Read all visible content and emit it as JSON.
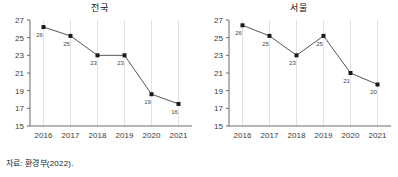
{
  "source_note": "자료: 환경부(2022).",
  "chart_data": [
    {
      "type": "line",
      "title": "전국",
      "xlabel": "",
      "ylabel": "",
      "grid": "vertical",
      "legend": "none",
      "categories": [
        "2016",
        "2017",
        "2018",
        "2019",
        "2020",
        "2021"
      ],
      "yticks": [
        15,
        17,
        19,
        21,
        23,
        25,
        27
      ],
      "ylim": [
        15,
        27
      ],
      "values": [
        26.2,
        25.2,
        23.0,
        23.0,
        18.6,
        17.5
      ],
      "point_labels": [
        "26",
        "25",
        "23",
        "23",
        "19",
        "16"
      ],
      "marker": "square",
      "marker_color": "#1a1a1a",
      "line_color": "#555555"
    },
    {
      "type": "line",
      "title": "서울",
      "xlabel": "",
      "ylabel": "",
      "grid": "vertical",
      "legend": "none",
      "categories": [
        "2016",
        "2017",
        "2018",
        "2019",
        "2020",
        "2021"
      ],
      "yticks": [
        15,
        17,
        19,
        21,
        23,
        25,
        27
      ],
      "ylim": [
        15,
        27
      ],
      "values": [
        26.4,
        25.2,
        23.0,
        25.2,
        21.0,
        19.7
      ],
      "point_labels": [
        "26",
        "25",
        "23",
        "25",
        "21",
        "20"
      ],
      "marker": "square",
      "marker_color": "#1a1a1a",
      "line_color": "#555555"
    }
  ],
  "colors": {
    "background": "#ffffff",
    "axis": "#6b6b6b",
    "gridline": "#e2e2e6",
    "line": "#555555",
    "marker": "#1a1a1a",
    "text": "#333333"
  }
}
